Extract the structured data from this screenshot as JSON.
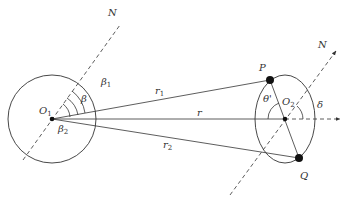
{
  "diagram": {
    "colors": {
      "stroke": "#333333",
      "background": "#ffffff"
    },
    "labels": {
      "N_left": "N",
      "N_right": "N",
      "O1": "O",
      "O1_sub": "1",
      "O2": "O",
      "O2_sub": "2",
      "P": "P",
      "Q": "Q",
      "r": "r",
      "r1": "r",
      "r1_sub": "1",
      "r2": "r",
      "r2_sub": "2",
      "beta": "β",
      "beta1": "β",
      "beta1_sub": "1",
      "beta2": "β",
      "beta2_sub": "2",
      "theta_prime": "θ'",
      "delta": "δ"
    },
    "nodes": [
      {
        "id": "O1",
        "x": 52,
        "y": 119
      },
      {
        "id": "O2",
        "x": 285,
        "y": 119
      },
      {
        "id": "P",
        "x": 270,
        "y": 80
      },
      {
        "id": "Q",
        "x": 299,
        "y": 158
      }
    ],
    "edges": [
      {
        "from": "O1",
        "to": "P",
        "label": "r1"
      },
      {
        "from": "O1",
        "to": "O2",
        "label": "r"
      },
      {
        "from": "O1",
        "to": "Q",
        "label": "r2"
      },
      {
        "from": "P",
        "to": "Q",
        "label": ""
      }
    ]
  }
}
